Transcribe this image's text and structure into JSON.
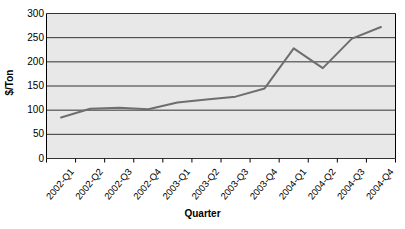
{
  "chart_data": {
    "type": "line",
    "title": "",
    "xlabel": "Quarter",
    "ylabel": "$/Ton",
    "categories": [
      "2002-Q1",
      "2002-Q2",
      "2002-Q3",
      "2002-Q4",
      "2003-Q1",
      "2003-Q2",
      "2003-Q3",
      "2003-Q4",
      "2004-Q1",
      "2004-Q2",
      "2004-Q3",
      "2004-Q4"
    ],
    "values": [
      85,
      103,
      105,
      102,
      116,
      122,
      128,
      145,
      228,
      187,
      248,
      272
    ],
    "series": [
      {
        "name": "$/Ton",
        "values": [
          85,
          103,
          105,
          102,
          116,
          122,
          128,
          145,
          228,
          187,
          248,
          272
        ]
      }
    ],
    "ylim": [
      0,
      300
    ],
    "yticks": [
      0,
      50,
      100,
      150,
      200,
      250,
      300
    ],
    "ytick_labels": [
      "0",
      "50",
      "100",
      "150",
      "200",
      "250",
      "300"
    ],
    "grid": true,
    "grid_axis": "y",
    "legend": false,
    "legend_position": "none",
    "colors": {
      "line": "#6e6e6e",
      "plot_background": "#e8e8e8",
      "grid": "#333333",
      "axis": "#000000",
      "figure_background": "#ffffff",
      "text": "#000000"
    },
    "line_width": 2
  }
}
